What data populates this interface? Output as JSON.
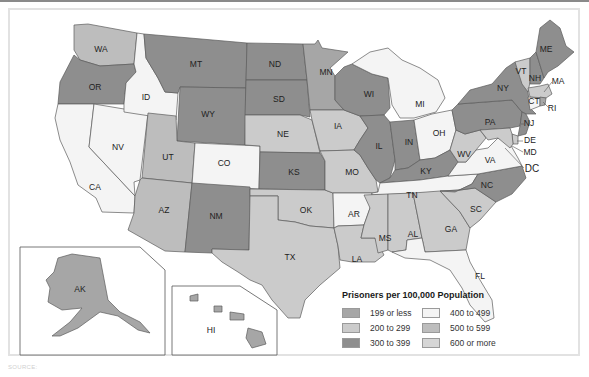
{
  "legend": {
    "title": "Prisoners per 100,000 Population",
    "items": [
      {
        "label": "199 or less",
        "color": "#a6a6a6"
      },
      {
        "label": "200 to 299",
        "color": "#cbcbcb"
      },
      {
        "label": "300 to 399",
        "color": "#8e8e8e"
      },
      {
        "label": "400 to 499",
        "color": "#f4f4f4"
      },
      {
        "label": "500 to 599",
        "color": "#bdbdbd"
      },
      {
        "label": "600 or more",
        "color": "#d6d6d6"
      }
    ]
  },
  "states": {
    "WA": "WA",
    "OR": "OR",
    "CA": "CA",
    "NV": "NV",
    "ID": "ID",
    "MT": "MT",
    "WY": "WY",
    "UT": "UT",
    "CO": "CO",
    "AZ": "AZ",
    "NM": "NM",
    "ND": "ND",
    "SD": "SD",
    "NE": "NE",
    "KS": "KS",
    "OK": "OK",
    "TX": "TX",
    "MN": "MN",
    "IA": "IA",
    "MO": "MO",
    "AR": "AR",
    "LA": "LA",
    "WI": "WI",
    "IL": "IL",
    "MS": "MS",
    "MI": "MI",
    "IN": "IN",
    "KY": "KY",
    "TN": "TN",
    "AL": "AL",
    "OH": "OH",
    "WV": "WV",
    "GA": "GA",
    "FL": "FL",
    "SC": "SC",
    "NC": "NC",
    "VA": "VA",
    "PA": "PA",
    "NY": "NY",
    "VT": "VT",
    "NH": "NH",
    "ME": "ME",
    "MA": "MA",
    "CT": "CT",
    "RI": "RI",
    "NJ": "NJ",
    "DE": "DE",
    "MD": "MD",
    "DC": "DC",
    "AK": "AK",
    "HI": "HI"
  },
  "source_note": "SOURCE: "
}
